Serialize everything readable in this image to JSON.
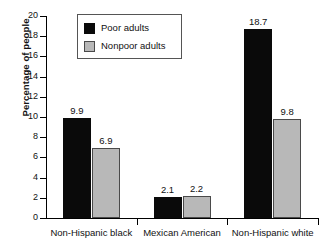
{
  "chart_data": {
    "type": "bar",
    "title": "",
    "xlabel": "",
    "ylabel": "Percentage of people",
    "ylim": [
      0,
      20
    ],
    "yticks": [
      0,
      2,
      4,
      6,
      8,
      10,
      12,
      14,
      16,
      18,
      20
    ],
    "ytick_labels": [
      "0",
      "2",
      "4",
      "6",
      "8",
      "10",
      "12",
      "14",
      "16",
      "18",
      "20"
    ],
    "grid": false,
    "legend_position": "upper-left-inside",
    "categories": [
      "Non-Hispanic black",
      "Mexican American",
      "Non-Hispanic white"
    ],
    "series": [
      {
        "name": "Poor adults",
        "color": "#0a0a0a",
        "values": [
          9.9,
          2.1,
          18.7
        ],
        "value_labels": [
          "9.9",
          "2.1",
          "18.7"
        ]
      },
      {
        "name": "Nonpoor adults",
        "color": "#b8b8b8",
        "edge_color": "#4a4a4a",
        "values": [
          6.9,
          2.2,
          9.8
        ],
        "value_labels": [
          "6.9",
          "2.2",
          "9.8"
        ]
      }
    ]
  },
  "legend": {
    "entries": [
      {
        "label": "Poor adults",
        "swatch": "black-square-swatch"
      },
      {
        "label": "Nonpoor adults",
        "swatch": "gray-square-swatch"
      }
    ]
  },
  "colors": {
    "poor": "#0a0a0a",
    "nonpoor": "#b8b8b8",
    "nonpoor_edge": "#4a4a4a",
    "axis": "#000000",
    "text": "#111111",
    "background": "#ffffff"
  }
}
